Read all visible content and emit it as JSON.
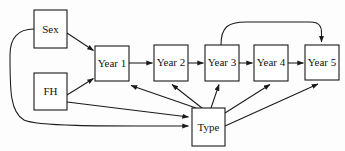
{
  "diagram": {
    "type": "directed-graph",
    "background_color": "#fdfdfd",
    "stroke_color": "#1a1a1a",
    "node_fill": "#ffffff",
    "nodes": [
      {
        "id": "sex",
        "label": "Sex",
        "x": 34,
        "y": 10,
        "w": 33,
        "h": 38
      },
      {
        "id": "fh",
        "label": "FH",
        "x": 34,
        "y": 73,
        "w": 33,
        "h": 37
      },
      {
        "id": "year1",
        "label": "Year 1",
        "x": 95,
        "y": 46,
        "w": 34,
        "h": 35
      },
      {
        "id": "year2",
        "label": "Year 2",
        "x": 154,
        "y": 45,
        "w": 34,
        "h": 36
      },
      {
        "id": "year3",
        "label": "Year 3",
        "x": 205,
        "y": 45,
        "w": 34,
        "h": 36
      },
      {
        "id": "year4",
        "label": "Year 4",
        "x": 254,
        "y": 45,
        "w": 34,
        "h": 36
      },
      {
        "id": "year5",
        "label": "Year 5",
        "x": 305,
        "y": 45,
        "w": 34,
        "h": 35
      },
      {
        "id": "type",
        "label": "Type",
        "x": 192,
        "y": 108,
        "w": 33,
        "h": 38
      }
    ],
    "edges": [
      {
        "id": "sex-year1",
        "from": "Sex",
        "to": "Year 1",
        "shape": "straight"
      },
      {
        "id": "sex-type",
        "from": "Sex",
        "to": "Type",
        "shape": "curved-left"
      },
      {
        "id": "fh-year1",
        "from": "FH",
        "to": "Year 1",
        "shape": "straight"
      },
      {
        "id": "fh-type",
        "from": "FH",
        "to": "Type",
        "shape": "straight"
      },
      {
        "id": "year1-year2",
        "from": "Year 1",
        "to": "Year 2",
        "shape": "straight"
      },
      {
        "id": "year2-year3",
        "from": "Year 2",
        "to": "Year 3",
        "shape": "straight"
      },
      {
        "id": "year3-year4",
        "from": "Year 3",
        "to": "Year 4",
        "shape": "straight"
      },
      {
        "id": "year4-year5",
        "from": "Year 4",
        "to": "Year 5",
        "shape": "straight"
      },
      {
        "id": "year3-year5",
        "from": "Year 3",
        "to": "Year 5",
        "shape": "curved-top"
      },
      {
        "id": "type-year1",
        "from": "Type",
        "to": "Year 1",
        "shape": "straight"
      },
      {
        "id": "type-year2",
        "from": "Type",
        "to": "Year 2",
        "shape": "straight"
      },
      {
        "id": "type-year3",
        "from": "Type",
        "to": "Year 3",
        "shape": "straight"
      },
      {
        "id": "type-year4",
        "from": "Type",
        "to": "Year 4",
        "shape": "straight"
      },
      {
        "id": "type-year5",
        "from": "Type",
        "to": "Year 5",
        "shape": "straight"
      }
    ]
  }
}
